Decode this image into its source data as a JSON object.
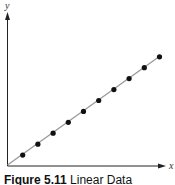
{
  "chart_data": {
    "type": "scatter",
    "title": "Figure 5.11 Linear Data",
    "xlabel": "x",
    "ylabel": "y",
    "grid": false,
    "legend": null,
    "trend_line": {
      "type": "linear",
      "from": [
        0,
        0
      ],
      "to": [
        10.2,
        7.2
      ]
    },
    "x": [
      1,
      2,
      3,
      4,
      5,
      6,
      7,
      8,
      9,
      10
    ],
    "y": [
      0.7,
      1.4,
      2.1,
      2.8,
      3.5,
      4.2,
      4.9,
      5.6,
      6.3,
      7.0
    ],
    "xlim": [
      0,
      10.5
    ],
    "ylim": [
      0,
      10
    ]
  },
  "caption": {
    "label": "Figure 5.11",
    "text": "Linear Data"
  }
}
